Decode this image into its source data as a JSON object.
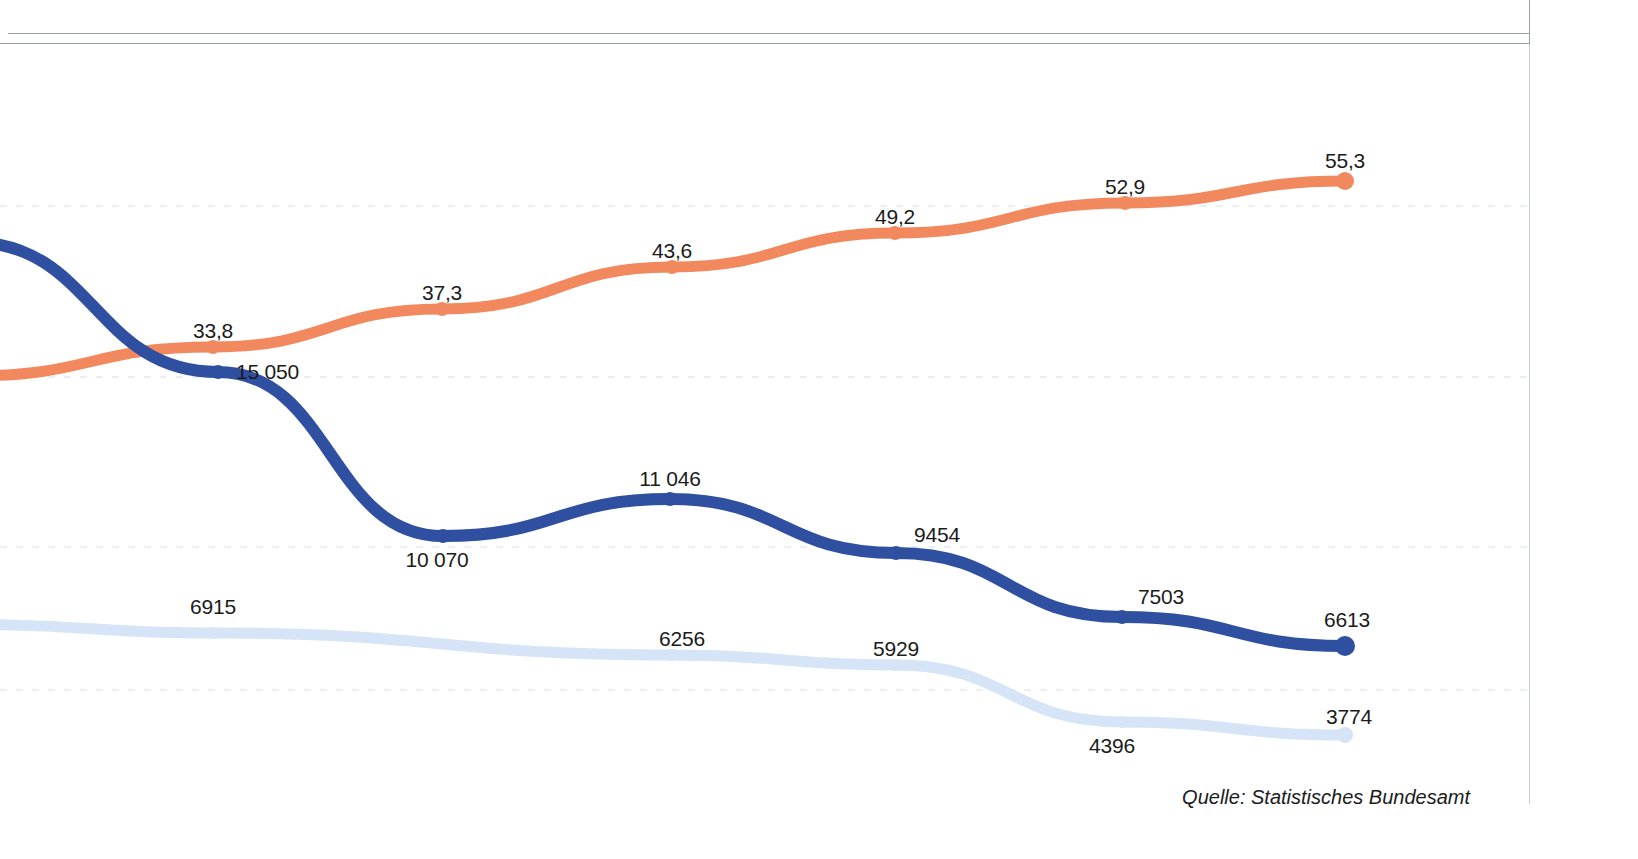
{
  "figure": {
    "source_note": "Quelle: Statistisches Bundesamt",
    "background": "#ffffff"
  },
  "colors": {
    "series_orange": "#F2895E",
    "series_blue": "#2F4FA0",
    "series_lightblue": "#D6E4F7",
    "label_text": "#1b1b1b",
    "frame_rule": "#9aa0a6",
    "gridline": "#eaeff6"
  },
  "labels": {
    "orange": [
      "33,8",
      "37,3",
      "43,6",
      "49,2",
      "52,9",
      "55,3"
    ],
    "blue": [
      "15 050",
      "10 070",
      "11 046",
      "9454",
      "7503",
      "6613"
    ],
    "lightblue": [
      "6915",
      "6256",
      "5929",
      "4396",
      "3774"
    ]
  },
  "chart_data": {
    "type": "line",
    "title": "",
    "subtitle": "",
    "xlabel": "",
    "ylabel": "",
    "grid": true,
    "legend_position": "none",
    "annotations": [
      "Quelle: Statistisches Bundesamt"
    ],
    "note": "Chart is cropped: the leftmost portion of every series runs off the left edge of the frame, so the earliest categories are not visible and only the labelled points are read off.",
    "series": [
      {
        "name": "Anteil in Prozent",
        "color": "#F2895E",
        "unit": "%",
        "values": [
          33.8,
          37.3,
          43.6,
          49.2,
          52.9,
          55.3
        ],
        "value_labels": [
          "33,8",
          "37,3",
          "43,6",
          "49,2",
          "52,9",
          "55,3"
        ],
        "points_px": [
          [
            213,
            347
          ],
          [
            442,
            309
          ],
          [
            672,
            267
          ],
          [
            895,
            233
          ],
          [
            1125,
            203
          ],
          [
            1345,
            181
          ]
        ]
      },
      {
        "name": "Anzahl (dunkelblau)",
        "color": "#2F4FA0",
        "unit": "",
        "values": [
          15050,
          10070,
          11046,
          9454,
          7503,
          6613
        ],
        "value_labels": [
          "15 050",
          "10 070",
          "11 046",
          "9454",
          "7503",
          "6613"
        ],
        "points_px": [
          [
            218,
            372
          ],
          [
            443,
            536
          ],
          [
            670,
            499
          ],
          [
            896,
            553
          ],
          [
            1122,
            617
          ],
          [
            1345,
            646
          ]
        ]
      },
      {
        "name": "Anzahl (hellblau)",
        "color": "#D6E4F7",
        "unit": "",
        "values": [
          6915,
          6256,
          5929,
          4396,
          3774
        ],
        "value_labels": [
          "6915",
          "6256",
          "5929",
          "4396",
          "3774"
        ],
        "points_px": [
          [
            213,
            633
          ],
          [
            672,
            655
          ],
          [
            896,
            665
          ],
          [
            1122,
            722
          ],
          [
            1345,
            735
          ]
        ]
      }
    ]
  }
}
